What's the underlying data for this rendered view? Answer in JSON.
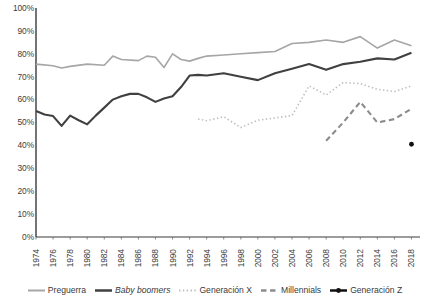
{
  "chart_data": {
    "type": "line",
    "title": "",
    "xlabel": "",
    "ylabel": "",
    "xlim": [
      1974,
      2019
    ],
    "ylim": [
      0,
      100
    ],
    "grid": false,
    "legend_position": "bottom",
    "y_ticks": [
      "100%",
      "90%",
      "80%",
      "70%",
      "60%",
      "50%",
      "40%",
      "30%",
      "20%",
      "10%",
      "0%"
    ],
    "y_tick_values": [
      100,
      90,
      80,
      70,
      60,
      50,
      40,
      30,
      20,
      10,
      0
    ],
    "x_ticks": [
      "1974",
      "1976",
      "1978",
      "1980",
      "1982",
      "1984",
      "1986",
      "1988",
      "1990",
      "1992",
      "1994",
      "1996",
      "1998",
      "2000",
      "2002",
      "2004",
      "2006",
      "2008",
      "2010",
      "2012",
      "2014",
      "2016",
      "2018"
    ],
    "x_tick_values": [
      1974,
      1976,
      1978,
      1980,
      1982,
      1984,
      1986,
      1988,
      1990,
      1992,
      1994,
      1996,
      1998,
      2000,
      2002,
      2004,
      2006,
      2008,
      2010,
      2012,
      2014,
      2016,
      2018
    ],
    "series": [
      {
        "name": "Preguerra",
        "style": "solid",
        "color": "#a6a6a6",
        "width": 1.6,
        "italic": false,
        "marker": "none",
        "x": [
          1974,
          1976,
          1977,
          1978,
          1980,
          1982,
          1983,
          1984,
          1986,
          1987,
          1988,
          1989,
          1990,
          1991,
          1992,
          1993,
          1994,
          1996,
          1998,
          2000,
          2002,
          2004,
          2006,
          2008,
          2010,
          2012,
          2014,
          2016,
          2018
        ],
        "values": [
          75.5,
          74.8,
          73.8,
          74.5,
          75.5,
          75.0,
          79.0,
          77.5,
          77.0,
          79.0,
          78.5,
          74.0,
          80.0,
          77.5,
          76.8,
          78.0,
          79.0,
          79.5,
          80.0,
          80.5,
          81.0,
          84.5,
          85.0,
          86.0,
          85.0,
          87.5,
          82.5,
          86.0,
          83.5
        ]
      },
      {
        "name": "Baby boomers",
        "style": "solid",
        "color": "#404040",
        "width": 2.1,
        "italic": true,
        "marker": "none",
        "x": [
          1974,
          1975,
          1976,
          1977,
          1978,
          1979,
          1980,
          1981,
          1982,
          1983,
          1984,
          1985,
          1986,
          1987,
          1988,
          1989,
          1990,
          1991,
          1992,
          1993,
          1994,
          1996,
          1998,
          2000,
          2002,
          2004,
          2006,
          2008,
          2010,
          2012,
          2014,
          2016,
          2018
        ],
        "values": [
          55.0,
          53.5,
          52.8,
          48.5,
          53.0,
          51.0,
          49.2,
          53.0,
          56.5,
          60.0,
          61.5,
          62.5,
          62.5,
          61.0,
          59.0,
          60.5,
          61.5,
          65.5,
          70.5,
          70.8,
          70.5,
          71.5,
          70.0,
          68.5,
          71.5,
          73.5,
          75.5,
          73.0,
          75.5,
          76.5,
          78.0,
          77.5,
          80.5
        ]
      },
      {
        "name": "Generación X",
        "style": "dotted",
        "color": "#bfbfbf",
        "width": 1.6,
        "italic": false,
        "marker": "none",
        "x": [
          1993,
          1994,
          1996,
          1998,
          2000,
          2002,
          2004,
          2006,
          2008,
          2010,
          2012,
          2014,
          2016,
          2018
        ],
        "values": [
          51.5,
          50.8,
          52.5,
          47.8,
          51.0,
          52.0,
          53.0,
          66.0,
          62.0,
          67.5,
          67.0,
          64.5,
          63.5,
          66.0
        ]
      },
      {
        "name": "Millennials",
        "style": "dashed",
        "color": "#8c8c8c",
        "width": 2.1,
        "italic": false,
        "marker": "none",
        "x": [
          2008,
          2010,
          2012,
          2014,
          2016,
          2018
        ],
        "values": [
          42.0,
          50.0,
          59.0,
          50.0,
          51.5,
          56.0
        ]
      },
      {
        "name": "Generación Z",
        "style": "solid",
        "color": "#111111",
        "width": 2.1,
        "italic": false,
        "marker": "dot",
        "x": [
          2018
        ],
        "values": [
          40.5
        ]
      }
    ]
  },
  "legend": {
    "items": [
      {
        "label": "Preguerra",
        "swatch": "legend-line-solid-gray"
      },
      {
        "label": "Baby boomers",
        "swatch": "legend-line-solid-dark"
      },
      {
        "label": "Generación X",
        "swatch": "legend-line-dotted-light"
      },
      {
        "label": "Millennials",
        "swatch": "legend-line-dashed-gray"
      },
      {
        "label": "Generación Z",
        "swatch": "legend-line-dot-black"
      }
    ]
  }
}
